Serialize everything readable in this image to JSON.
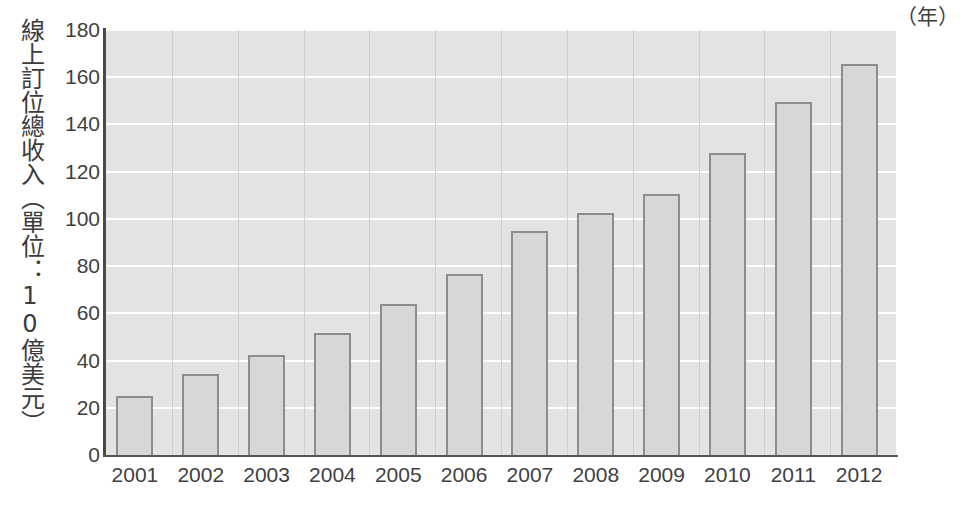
{
  "chart_data": {
    "type": "bar",
    "title": "",
    "subtitle": "",
    "xlabel": "（年）",
    "ylabel": "線上訂位總收入（單位：10億美元）",
    "categories": [
      "2001",
      "2002",
      "2003",
      "2004",
      "2005",
      "2006",
      "2007",
      "2008",
      "2009",
      "2010",
      "2011",
      "2012"
    ],
    "values": [
      25,
      34.5,
      42.5,
      51.5,
      64,
      76.5,
      95,
      102.5,
      110.5,
      128,
      149.5,
      165.5
    ],
    "ylim": [
      0,
      180
    ],
    "ytick_labels": [
      "0",
      "20",
      "40",
      "60",
      "80",
      "100",
      "120",
      "140",
      "160",
      "180"
    ],
    "ytick_values": [
      0,
      20,
      40,
      60,
      80,
      100,
      120,
      140,
      160,
      180
    ],
    "grid": "horizontal",
    "legend": "none",
    "annotations": [],
    "colors": {
      "bar_fill": "#d7d7d7",
      "bar_border": "#8d8d8d",
      "plot_background": "#e3e3e3",
      "gridline": "#fdfdfd",
      "axis": "#4a4a4a",
      "text": "#3f3f3f",
      "page_background": "#ffffff"
    }
  }
}
